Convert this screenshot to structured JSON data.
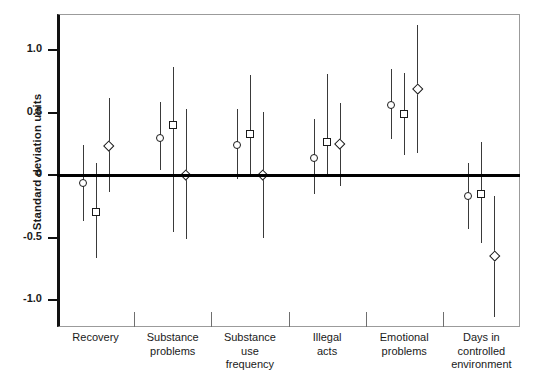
{
  "chart_data": {
    "type": "scatter",
    "title": "",
    "xlabel": "",
    "ylabel": "Standard deviation units",
    "ylim": [
      -1.22,
      1.28
    ],
    "yticks": [
      1.0,
      0.5,
      0,
      -0.5,
      -1.0
    ],
    "ytick_labels": [
      "1.0",
      "0.5",
      "0",
      "-0.5",
      "-1.0"
    ],
    "grid": false,
    "legend": "none",
    "zero_reference_line": 0,
    "categories": [
      "Recovery",
      "Substance problems",
      "Substance use frequency",
      "Illegal acts",
      "Emotional problems",
      "Days in controlled environment"
    ],
    "category_labels": [
      [
        "Recovery"
      ],
      [
        "Substance",
        "problems"
      ],
      [
        "Substance",
        "use",
        "frequency"
      ],
      [
        "Illegal",
        "acts"
      ],
      [
        "Emotional",
        "problems"
      ],
      [
        "Days in",
        "controlled",
        "environment"
      ]
    ],
    "series": [
      {
        "name": "series-1",
        "marker": "circle",
        "values": [
          -0.07,
          0.29,
          0.23,
          0.13,
          0.55,
          -0.17
        ],
        "ci_low": [
          -0.37,
          0.03,
          -0.04,
          -0.16,
          0.28,
          -0.44
        ],
        "ci_high": [
          0.23,
          0.58,
          0.52,
          0.44,
          0.84,
          0.09
        ]
      },
      {
        "name": "series-2",
        "marker": "square",
        "values": [
          -0.3,
          0.39,
          0.32,
          0.26,
          0.48,
          -0.16
        ],
        "ci_low": [
          -0.67,
          -0.46,
          -0.01,
          -0.01,
          0.15,
          -0.55
        ],
        "ci_high": [
          0.09,
          0.86,
          0.79,
          0.8,
          0.81,
          0.26
        ]
      },
      {
        "name": "series-3",
        "marker": "diamond",
        "values": [
          0.23,
          0.0,
          0.0,
          0.24,
          0.68,
          -0.65
        ],
        "ci_low": [
          -0.14,
          -0.52,
          -0.51,
          -0.09,
          0.17,
          -1.14
        ],
        "ci_high": [
          0.61,
          0.52,
          0.5,
          0.57,
          1.19,
          -0.17
        ]
      }
    ]
  },
  "axis": {
    "y_title": "Standard deviation units"
  }
}
